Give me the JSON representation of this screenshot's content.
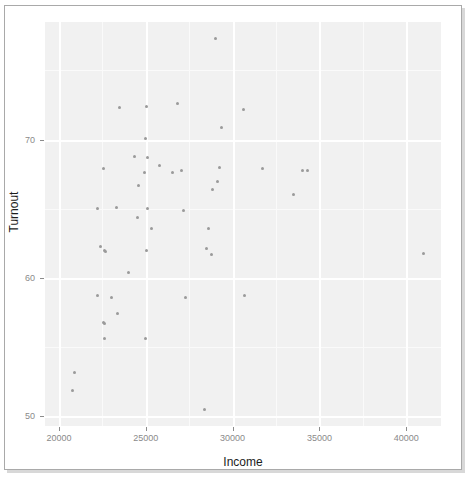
{
  "chart_data": {
    "type": "scatter",
    "title": "",
    "xlabel": "Income",
    "ylabel": "Turnout",
    "xlim": [
      19200,
      42000
    ],
    "ylim": [
      49.3,
      78.5
    ],
    "xticks": [
      20000,
      25000,
      30000,
      35000,
      40000
    ],
    "yticks": [
      50,
      60,
      70
    ],
    "xtick_labels": [
      "20000",
      "25000",
      "30000",
      "35000",
      "40000"
    ],
    "ytick_labels": [
      "50",
      "60",
      "70"
    ],
    "grid": true,
    "legend": false,
    "point_color": "#9a9a9a",
    "panel_color": "#f1f1f1",
    "grid_color": "#ffffff",
    "points": [
      {
        "x": 29000,
        "y": 77.3
      },
      {
        "x": 25050,
        "y": 72.4
      },
      {
        "x": 26800,
        "y": 72.6
      },
      {
        "x": 23500,
        "y": 72.3
      },
      {
        "x": 30600,
        "y": 72.2
      },
      {
        "x": 29350,
        "y": 70.9
      },
      {
        "x": 25000,
        "y": 70.1
      },
      {
        "x": 24350,
        "y": 68.8
      },
      {
        "x": 25100,
        "y": 68.7
      },
      {
        "x": 22550,
        "y": 67.9
      },
      {
        "x": 25800,
        "y": 68.1
      },
      {
        "x": 26550,
        "y": 67.6
      },
      {
        "x": 27050,
        "y": 67.8
      },
      {
        "x": 24900,
        "y": 67.6
      },
      {
        "x": 29250,
        "y": 68.0
      },
      {
        "x": 31750,
        "y": 67.9
      },
      {
        "x": 34000,
        "y": 67.8
      },
      {
        "x": 34300,
        "y": 67.8
      },
      {
        "x": 24600,
        "y": 66.7
      },
      {
        "x": 29150,
        "y": 67.0
      },
      {
        "x": 28850,
        "y": 66.4
      },
      {
        "x": 33500,
        "y": 66.0
      },
      {
        "x": 22200,
        "y": 65.0
      },
      {
        "x": 23300,
        "y": 65.1
      },
      {
        "x": 25100,
        "y": 65.0
      },
      {
        "x": 27200,
        "y": 64.9
      },
      {
        "x": 24500,
        "y": 64.4
      },
      {
        "x": 25350,
        "y": 63.6
      },
      {
        "x": 28600,
        "y": 63.6
      },
      {
        "x": 22400,
        "y": 62.3
      },
      {
        "x": 22600,
        "y": 62.0
      },
      {
        "x": 22700,
        "y": 61.9
      },
      {
        "x": 25050,
        "y": 62.0
      },
      {
        "x": 28500,
        "y": 62.1
      },
      {
        "x": 28800,
        "y": 61.7
      },
      {
        "x": 41000,
        "y": 61.8
      },
      {
        "x": 24000,
        "y": 60.4
      },
      {
        "x": 22250,
        "y": 58.7
      },
      {
        "x": 23050,
        "y": 58.6
      },
      {
        "x": 27300,
        "y": 58.6
      },
      {
        "x": 30700,
        "y": 58.7
      },
      {
        "x": 23400,
        "y": 57.4
      },
      {
        "x": 22550,
        "y": 56.8
      },
      {
        "x": 22600,
        "y": 56.7
      },
      {
        "x": 22650,
        "y": 55.6
      },
      {
        "x": 25000,
        "y": 55.6
      },
      {
        "x": 20900,
        "y": 53.2
      },
      {
        "x": 20800,
        "y": 51.9
      },
      {
        "x": 28400,
        "y": 50.5
      }
    ]
  }
}
